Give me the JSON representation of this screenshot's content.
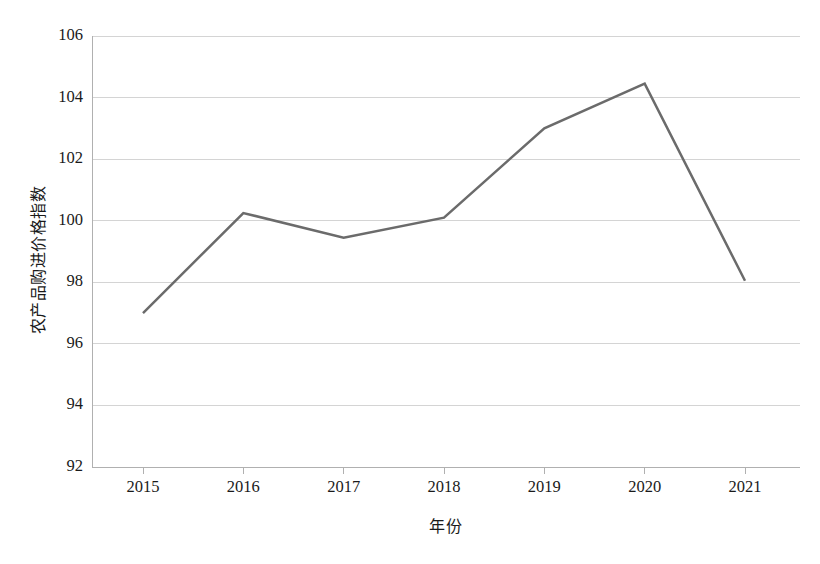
{
  "chart_data": {
    "type": "line",
    "title": "",
    "xlabel": "年份",
    "ylabel": "农产品购进价格指数",
    "categories": [
      "2015",
      "2016",
      "2017",
      "2018",
      "2019",
      "2020",
      "2021"
    ],
    "x": [
      2015,
      2016,
      2017,
      2018,
      2019,
      2020,
      2021
    ],
    "values": [
      97.0,
      100.25,
      99.45,
      100.1,
      103.0,
      104.45,
      98.05
    ],
    "series": [
      {
        "name": "农产品购进价格指数",
        "values": [
          97.0,
          100.25,
          99.45,
          100.1,
          103.0,
          104.45,
          98.05
        ]
      }
    ],
    "ylim": [
      92,
      106
    ],
    "yticks": [
      92,
      94,
      96,
      98,
      100,
      102,
      104,
      106
    ],
    "ytick_labels": [
      "92",
      "94",
      "96",
      "98",
      "100",
      "102",
      "104",
      "106"
    ],
    "xtick_labels": [
      "2015",
      "2016",
      "2017",
      "2018",
      "2019",
      "2020",
      "2021"
    ],
    "grid": true,
    "grid_axis": "y",
    "legend": false,
    "legend_position": "none",
    "line_color": "#6b6b6b",
    "grid_color": "#d4d4d4",
    "axis_color": "#b0b0b0",
    "background_color": "#ffffff",
    "text_color": "#1a1a1a",
    "marker": "none",
    "line_width": 2.5
  },
  "axes": {
    "y_title": "农产品购进价格指数",
    "x_title": "年份"
  }
}
